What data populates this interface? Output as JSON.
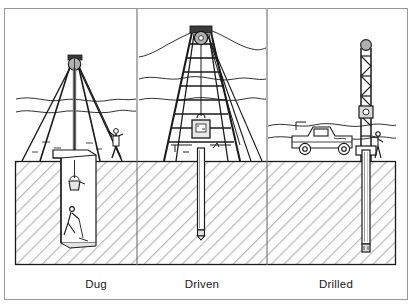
{
  "figure": {
    "background_color": "#ffffff",
    "frame": {
      "stroke": "#9a9a9a",
      "x": 4,
      "y": 8,
      "width": 404,
      "height": 292
    },
    "ground": {
      "surface_label": "ground surface",
      "box": {
        "x": 15,
        "y": 161,
        "width": 381,
        "height": 104
      },
      "fill": "#ffffff",
      "hatch_color": "#b9b9b9",
      "outline_color": "#1a1a1a",
      "hatch_angle_degrees": 45
    },
    "dividers": {
      "color": "#6f6f6f",
      "x_positions": [
        137,
        267
      ]
    }
  },
  "panels": [
    {
      "id": "dug",
      "label": "Dug",
      "label_x": 96,
      "label_y": 288,
      "method_name": "dug-well",
      "equipment": "tripod derrick with hand windlass pulley",
      "elements": [
        {
          "name": "tripod-derrick",
          "type": "frame"
        },
        {
          "name": "crown-pulley-wheel",
          "type": "wheel",
          "fill": "#b0b0b0"
        },
        {
          "name": "hoist-rope",
          "type": "line"
        },
        {
          "name": "guy-lines",
          "type": "lines"
        },
        {
          "name": "standing-worker-figure",
          "type": "person"
        },
        {
          "name": "excavation-shaft",
          "type": "shaft"
        },
        {
          "name": "spoil-bucket",
          "type": "bucket"
        },
        {
          "name": "digging-worker-figure",
          "type": "person"
        },
        {
          "name": "horizon-terrain-lines",
          "type": "terrain"
        }
      ],
      "shaft": {
        "kind": "wide-hand-dug-shaft",
        "x": 62,
        "top_y": 158,
        "width": 34,
        "bottom_y": 243
      }
    },
    {
      "id": "driven",
      "label": "Driven",
      "label_x": 202,
      "label_y": 288,
      "method_name": "driven-well",
      "equipment": "tall ladder derrick with drop hammer drive weight",
      "elements": [
        {
          "name": "ladder-derrick",
          "type": "frame"
        },
        {
          "name": "crown-pulley-wheel",
          "type": "wheel",
          "fill": "#b0b0b0"
        },
        {
          "name": "drive-hammer-weight",
          "type": "weight"
        },
        {
          "name": "guy-lines",
          "type": "lines"
        },
        {
          "name": "drive-pipe",
          "type": "pipe"
        },
        {
          "name": "well-point-tip",
          "type": "tip"
        },
        {
          "name": "horizon-terrain-lines",
          "type": "terrain"
        }
      ],
      "shaft": {
        "kind": "narrow-driven-pipe",
        "x": 197,
        "top_y": 148,
        "width": 7,
        "bottom_y": 238
      }
    },
    {
      "id": "drilled",
      "label": "Drilled",
      "label_x": 336,
      "label_y": 288,
      "method_name": "drilled-well",
      "equipment": "truck-mounted rotary drilling rig with lattice mast",
      "elements": [
        {
          "name": "drill-rig-truck",
          "type": "vehicle"
        },
        {
          "name": "lattice-mast",
          "type": "mast"
        },
        {
          "name": "crown-pulley-wheel",
          "type": "wheel",
          "fill": "#b0b0b0"
        },
        {
          "name": "travelling-block",
          "type": "block"
        },
        {
          "name": "rig-operator-figure",
          "type": "person"
        },
        {
          "name": "drill-pipe-string",
          "type": "pipe"
        },
        {
          "name": "drill-bit",
          "type": "tip"
        },
        {
          "name": "horizon-terrain-lines",
          "type": "terrain"
        }
      ],
      "shaft": {
        "kind": "narrow-drilled-borehole",
        "x": 364,
        "top_y": 150,
        "width": 8,
        "bottom_y": 250
      }
    }
  ]
}
